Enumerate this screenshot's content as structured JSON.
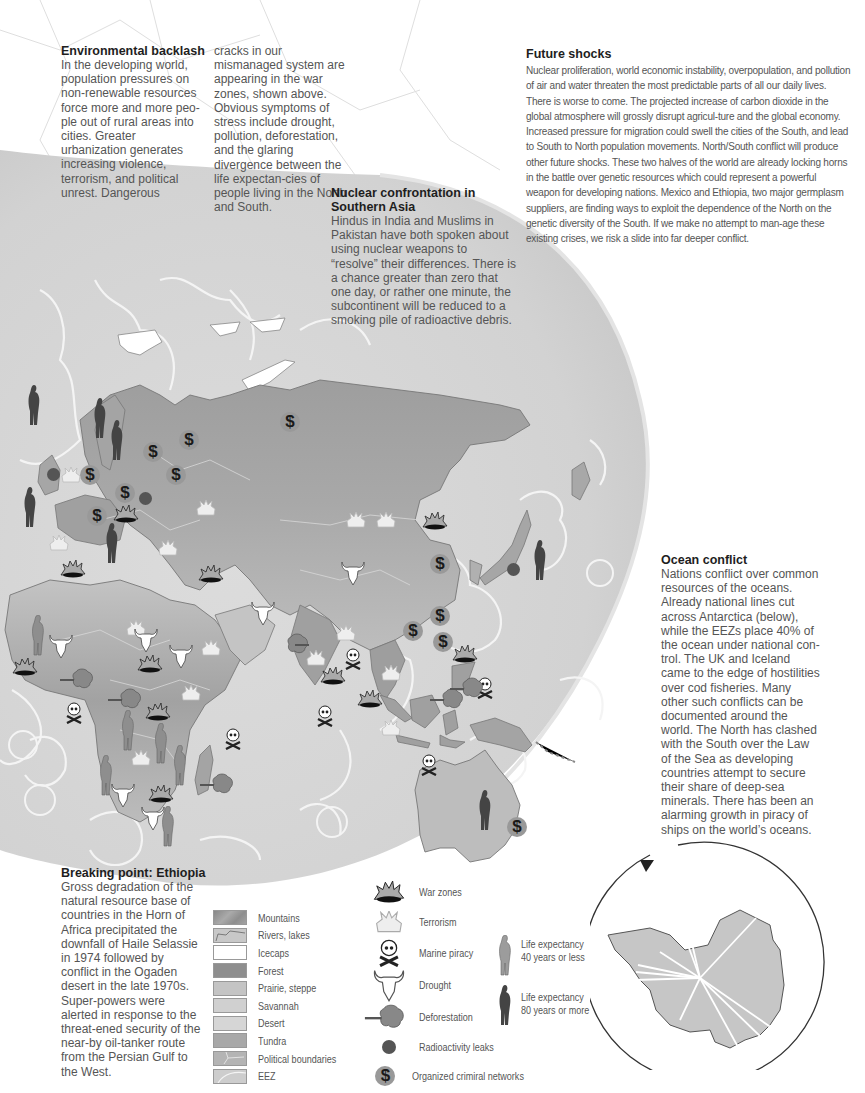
{
  "sections": {
    "environmental_backlash": {
      "title": "Environmental backlash",
      "col1": "In the developing world, population pressures on non-renewable resources force more and more peo-ple out of rural areas into cities. Greater urbanization generates increasing violence, terrorism, and political unrest. Dangerous",
      "col2": "cracks in our mismanaged system are appearing in the war zones, shown above. Obvious symptoms of stress include drought, pollution, deforestation, and the glaring divergence between the life expectan-cies of people living in the North and South."
    },
    "future_shocks": {
      "title": "Future shocks",
      "body": "Nuclear proliferation, world economic instability, overpopulation, and pollution of air and water threaten the most predictable parts of all our daily lives. There is worse to come. The projected increase of carbon dioxide in the global atmosphere will grossly disrupt agricul-ture and the global economy. Increased pressure for migration could swell the cities of the South, and lead to South to North population movements. North/South conflict will produce other future shocks. These two halves of the world are already locking horns in the battle over genetic resources which could represent a powerful weapon for developing nations. Mexico and Ethiopia, two major germplasm suppliers, are finding ways to exploit the dependence of the North on the genetic diversity of the South. If we make no attempt to man-age these existing crises, we risk a slide into far deeper conflict."
    },
    "nuclear_confrontation": {
      "title_line1": "Nuclear confrontation in",
      "title_line2": "Southern Asia",
      "body": "Hindus in India and Muslims in Pakistan have both spoken about using nuclear weapons to “resolve” their differences. There is a chance greater than zero that one day, or rather one minute, the subcontinent will be reduced to a smoking pile of radioactive debris."
    },
    "ocean_conflict": {
      "title": "Ocean conflict",
      "body": "Nations conflict over common resources of the oceans. Already national lines cut across Antarctica (below), while the EEZs place 40% of the ocean under national con-trol. The UK and Iceland came to the edge of hostilities over cod fisheries. Many other such conflicts can be documented around the world. The North has clashed with the South over the Law of the Sea as developing countries attempt to secure their share of deep-sea minerals. There has been an alarming growth in piracy of ships on the world’s oceans."
    },
    "breaking_point": {
      "title": "Breaking point: Ethiopia",
      "body": "Gross degradation of the natural resource base of countries in the Horn of Africa precipitated the downfall of Haile Selassie in 1974 followed by conflict in the Ogaden desert in the late 1970s. Super-powers were alerted in response to the threat-ened security of the near-by oil-tanker route from the Persian Gulf to the West."
    }
  },
  "legend": {
    "terrain": [
      {
        "label": "Mountains",
        "swatch": "#9a9a9a"
      },
      {
        "label": "Rivers, lakes",
        "swatch": "#c8c8c8"
      },
      {
        "label": "Icecaps",
        "swatch": "#ffffff"
      },
      {
        "label": "Forest",
        "swatch": "#8e8e8e"
      },
      {
        "label": "Prairie, steppe",
        "swatch": "#c4c4c4"
      },
      {
        "label": "Savannah",
        "swatch": "#d0d0d0"
      },
      {
        "label": "Desert",
        "swatch": "#d6d6d6"
      },
      {
        "label": "Tundra",
        "swatch": "#a8a8a8"
      },
      {
        "label": "Political boundaries",
        "swatch": "#b4b4b4"
      },
      {
        "label": "EEZ",
        "swatch": "#cdcdcd"
      }
    ],
    "symbols": [
      {
        "label": "War zones",
        "icon": "war-zone-icon"
      },
      {
        "label": "Terrorism",
        "icon": "terrorism-icon"
      },
      {
        "label": "Marine piracy",
        "icon": "skull-crossbones-icon"
      },
      {
        "label": "Drought",
        "icon": "bull-skull-icon"
      },
      {
        "label": "Deforestation",
        "icon": "deforestation-icon"
      },
      {
        "label": "Radioactivity leaks",
        "icon": "radioactivity-dot-icon"
      },
      {
        "label": "Organized crimiral networks",
        "icon": "dollar-icon"
      }
    ],
    "life": [
      {
        "label_line1": "Life expectancy",
        "label_line2": "40 years or less",
        "color": "#9c9c9c"
      },
      {
        "label_line1": "Life expectancy",
        "label_line2": "80 years or more",
        "color": "#444444"
      }
    ]
  },
  "colors": {
    "ocean_globe": "#d4d4d4",
    "land": "#b8b8b8",
    "land_dark": "#9a9a9a",
    "eez_line": "#f2f2f2",
    "antarctica": "#c6c6c6"
  }
}
